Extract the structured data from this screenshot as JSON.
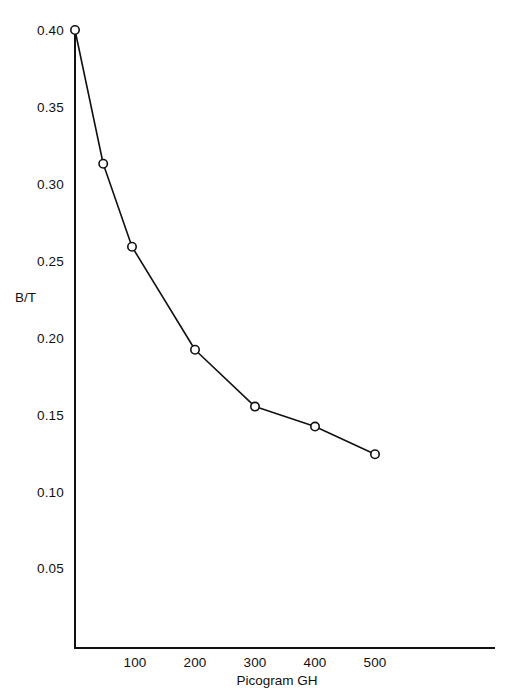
{
  "chart_data": {
    "type": "line",
    "title": "",
    "xlabel": "Picogram GH",
    "ylabel": "B/T",
    "xlim": [
      0,
      560
    ],
    "ylim": [
      0,
      0.4125
    ],
    "grid": false,
    "legend": null,
    "marker": "open-circle",
    "line_color": "#111111",
    "marker_color": "#111111",
    "x_ticks": [
      100,
      200,
      300,
      400,
      500
    ],
    "x_tick_labels": [
      "100",
      "200",
      "300",
      "400",
      "500"
    ],
    "y_ticks": [
      0.05,
      0.1,
      0.15,
      0.2,
      0.25,
      0.3,
      0.35,
      0.4
    ],
    "y_tick_labels": [
      "0.05",
      "0.10",
      "0.15",
      "0.20",
      "0.25",
      "0.30",
      "0.35",
      "0.40"
    ],
    "x": [
      0,
      47,
      95,
      200,
      300,
      400,
      500
    ],
    "values": [
      0.4,
      0.313,
      0.259,
      0.192,
      0.155,
      0.142,
      0.124
    ],
    "points": [
      {
        "x": 0,
        "y": 0.4
      },
      {
        "x": 47,
        "y": 0.313
      },
      {
        "x": 95,
        "y": 0.259
      },
      {
        "x": 200,
        "y": 0.192
      },
      {
        "x": 300,
        "y": 0.155
      },
      {
        "x": 400,
        "y": 0.142
      },
      {
        "x": 500,
        "y": 0.124
      }
    ]
  },
  "axes": {
    "y_title": "B/T",
    "x_title": "Picogram GH"
  },
  "colors": {
    "background": "#ffffff",
    "axis": "#111111",
    "data": "#111111"
  }
}
